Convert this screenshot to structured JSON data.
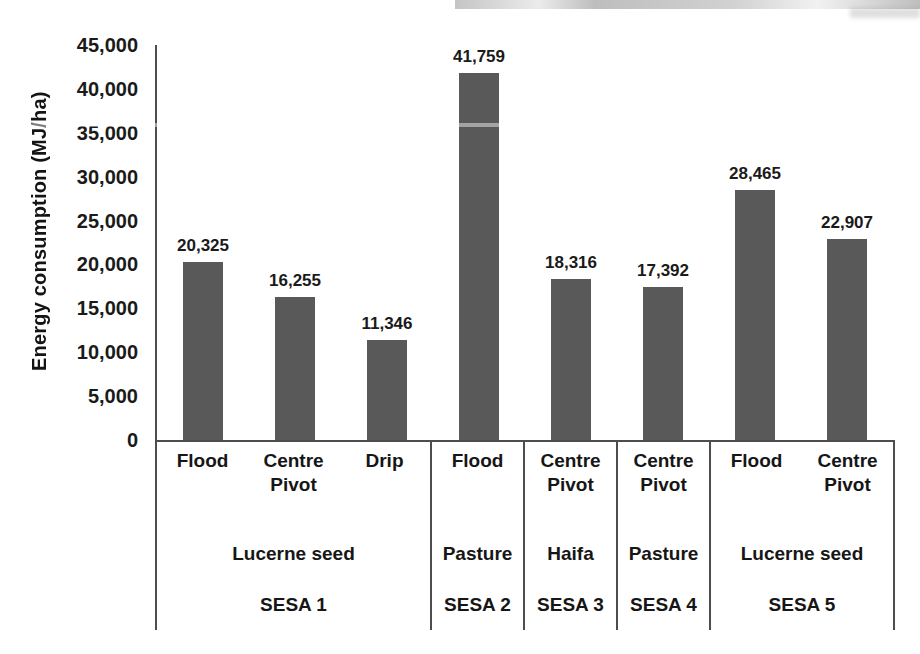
{
  "chart_data": {
    "type": "bar",
    "title": "",
    "xlabel": "",
    "ylabel": "Energy consumption (MJ/ha)",
    "ylim": [
      0,
      45000
    ],
    "ytick_step": 5000,
    "ytick_labels": [
      "0",
      "5,000",
      "10,000",
      "15,000",
      "20,000",
      "25,000",
      "30,000",
      "35,000",
      "40,000",
      "45,000"
    ],
    "grid": "off",
    "legend": "none",
    "bar_color": "#595959",
    "categories": [
      "SESA 1 / Lucerne seed / Flood",
      "SESA 1 / Lucerne seed / Centre Pivot",
      "SESA 1 / Lucerne seed / Drip",
      "SESA 2 / Pasture / Flood",
      "SESA 3 / Haifa / Centre Pivot",
      "SESA 4 / Pasture / Centre Pivot",
      "SESA 5 / Lucerne seed / Flood",
      "SESA 5 / Lucerne seed / Centre Pivot"
    ],
    "values": [
      20325,
      16255,
      11346,
      41759,
      18316,
      17392,
      28465,
      22907
    ],
    "groups": [
      {
        "sesa": "SESA 1",
        "crop": "Lucerne seed",
        "bars": [
          {
            "method": "Flood",
            "value": 20325,
            "label": "20,325"
          },
          {
            "method": "Centre Pivot",
            "value": 16255,
            "label": "16,255"
          },
          {
            "method": "Drip",
            "value": 11346,
            "label": "11,346"
          }
        ]
      },
      {
        "sesa": "SESA 2",
        "crop": "Pasture",
        "bars": [
          {
            "method": "Flood",
            "value": 41759,
            "label": "41,759"
          }
        ]
      },
      {
        "sesa": "SESA 3",
        "crop": "Haifa",
        "bars": [
          {
            "method": "Centre Pivot",
            "value": 18316,
            "label": "18,316"
          }
        ]
      },
      {
        "sesa": "SESA 4",
        "crop": "Pasture",
        "bars": [
          {
            "method": "Centre Pivot",
            "value": 17392,
            "label": "17,392"
          }
        ]
      },
      {
        "sesa": "SESA 5",
        "crop": "Lucerne seed",
        "bars": [
          {
            "method": "Flood",
            "value": 28465,
            "label": "28,465"
          },
          {
            "method": "Centre Pivot",
            "value": 22907,
            "label": "22,907"
          }
        ]
      }
    ]
  }
}
